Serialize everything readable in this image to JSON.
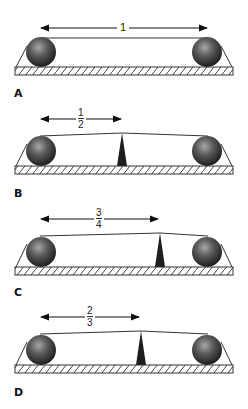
{
  "figure": {
    "colors": {
      "ink": "#222222",
      "ball_dark": "#2a2a2a",
      "ball_light": "#9a9a9a",
      "fulcrum": "#1e1e1e",
      "hatch": "#444444"
    },
    "panels": [
      {
        "id": "A",
        "label": "A",
        "ratio_label": "1",
        "ratio_num": "",
        "ratio_den": "",
        "fulcrum": false
      },
      {
        "id": "B",
        "label": "B",
        "ratio_label": "",
        "ratio_num": "1",
        "ratio_den": "2",
        "fulcrum": true
      },
      {
        "id": "C",
        "label": "C",
        "ratio_label": "",
        "ratio_num": "3",
        "ratio_den": "4",
        "fulcrum": true
      },
      {
        "id": "D",
        "label": "D",
        "ratio_label": "",
        "ratio_num": "2",
        "ratio_den": "3",
        "fulcrum": true
      }
    ]
  }
}
